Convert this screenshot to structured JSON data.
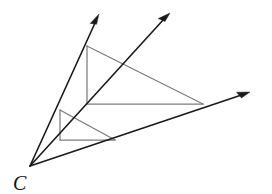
{
  "figure": {
    "background_color": "#ffffff",
    "ray_color": "#1a1a1a",
    "polygon_color": "#7d7d7d",
    "label_color": "#111111",
    "width": 272,
    "height": 194,
    "vertex": {
      "name": "C",
      "label": "C",
      "x": 30,
      "y": 166,
      "label_x": 13,
      "label_y": 190
    },
    "rays": [
      {
        "name": "ray-upper-left",
        "from": [
          30,
          166
        ],
        "to": [
          99,
          14
        ],
        "arrow": true
      },
      {
        "name": "ray-middle",
        "from": [
          30,
          166
        ],
        "to": [
          170,
          13
        ],
        "arrow": true
      },
      {
        "name": "ray-lower-right",
        "from": [
          30,
          166
        ],
        "to": [
          250,
          92
        ],
        "arrow": true
      }
    ],
    "polygons": [
      {
        "name": "large-right-triangle",
        "points": "87,46 87,104 203,104",
        "closed": true
      },
      {
        "name": "large-triangle-hypotenuse",
        "points": "87,46 203,104",
        "closed": false
      },
      {
        "name": "small-right-triangle",
        "points": "60,110 60,140 115,140",
        "closed": true
      },
      {
        "name": "small-triangle-hypotenuse",
        "points": "60,110 115,140",
        "closed": false
      }
    ]
  }
}
